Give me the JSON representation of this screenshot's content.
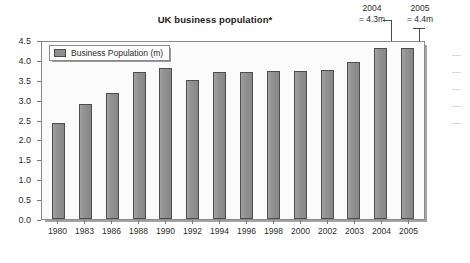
{
  "chart_data": {
    "type": "bar",
    "title": "UK business population*",
    "xlabel": "",
    "ylabel": "",
    "ylim": [
      0.0,
      4.5
    ],
    "ytick_step": 0.5,
    "grid": false,
    "legend_position": "top-left",
    "categories": [
      "1980",
      "1983",
      "1986",
      "1988",
      "1990",
      "1992",
      "1994",
      "1996",
      "1998",
      "2000",
      "2002",
      "2003",
      "2004",
      "2005"
    ],
    "values": [
      2.42,
      2.88,
      3.18,
      3.69,
      3.79,
      3.5,
      3.7,
      3.7,
      3.71,
      3.71,
      3.75,
      3.95,
      4.29,
      4.31
    ],
    "series": [
      {
        "name": "Business Population (m)",
        "values": [
          2.42,
          2.88,
          3.18,
          3.69,
          3.79,
          3.5,
          3.7,
          3.7,
          3.71,
          3.71,
          3.75,
          3.95,
          4.29,
          4.31
        ]
      }
    ],
    "ytick_labels": [
      "0.0",
      "0.5",
      "1.0",
      "1.5",
      "2.0",
      "2.5",
      "3.0",
      "3.5",
      "4.0",
      "4.5"
    ],
    "ytick_values": [
      0.0,
      0.5,
      1.0,
      1.5,
      2.0,
      2.5,
      3.0,
      3.5,
      4.0,
      4.5
    ],
    "annotations": [
      {
        "year": "2004",
        "value": "= 4.3m",
        "target_category": "2004"
      },
      {
        "year": "2005",
        "value": "= 4.4m",
        "target_category": "2005"
      }
    ],
    "colors": {
      "bar_fill": "#8e8e8e",
      "bar_stroke": "#4e4e4e",
      "plot_background": "#fbfbfb",
      "frame_stroke": "#8a8a8a",
      "text": "#2b2b2b"
    }
  },
  "legend": {
    "label": "Business Population (m)"
  }
}
